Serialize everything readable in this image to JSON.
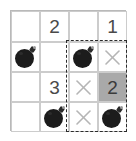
{
  "puzzle": {
    "type": "minesweeper-grid",
    "rows": 4,
    "columns": 4,
    "colors": {
      "grid_line": "#cccccc",
      "grid_border": "#b9b9b9",
      "background": "#ffffff",
      "shaded_cell": "#a9a9a9",
      "number_text": "#4a4a4a",
      "x_mark": "#b5b5b5",
      "bomb": "#1c1c1c",
      "selection_outline": "#2b2b2b"
    },
    "selection": {
      "label": "dashed-selection-region",
      "style": "dashed",
      "covers_columns": "3-4",
      "covers_rows": "2-4"
    },
    "cells": [
      {
        "row": 1,
        "col": 1,
        "kind": "empty",
        "value": ""
      },
      {
        "row": 1,
        "col": 2,
        "kind": "number",
        "value": "2"
      },
      {
        "row": 1,
        "col": 3,
        "kind": "empty",
        "value": ""
      },
      {
        "row": 1,
        "col": 4,
        "kind": "number",
        "value": "1"
      },
      {
        "row": 2,
        "col": 1,
        "kind": "bomb",
        "value": ""
      },
      {
        "row": 2,
        "col": 2,
        "kind": "empty",
        "value": ""
      },
      {
        "row": 2,
        "col": 3,
        "kind": "bomb",
        "value": ""
      },
      {
        "row": 2,
        "col": 4,
        "kind": "x",
        "value": ""
      },
      {
        "row": 3,
        "col": 1,
        "kind": "empty",
        "value": ""
      },
      {
        "row": 3,
        "col": 2,
        "kind": "number",
        "value": "3"
      },
      {
        "row": 3,
        "col": 3,
        "kind": "x",
        "value": ""
      },
      {
        "row": 3,
        "col": 4,
        "kind": "number",
        "value": "2",
        "shaded": true
      },
      {
        "row": 4,
        "col": 1,
        "kind": "empty",
        "value": ""
      },
      {
        "row": 4,
        "col": 2,
        "kind": "bomb",
        "value": ""
      },
      {
        "row": 4,
        "col": 3,
        "kind": "x",
        "value": ""
      },
      {
        "row": 4,
        "col": 4,
        "kind": "bomb",
        "value": ""
      }
    ]
  }
}
